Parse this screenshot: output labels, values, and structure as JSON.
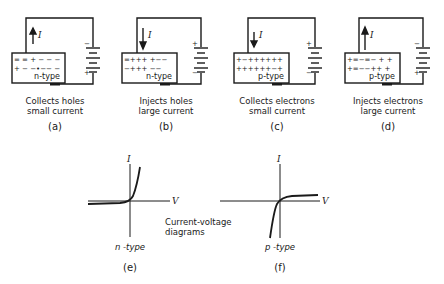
{
  "panels": [
    {
      "id": "a",
      "label": "(a)",
      "caption_line1": "Collects holes",
      "caption_line2": "small current",
      "material": "n-type",
      "current_dir": "up",
      "battery_top": "-",
      "battery_bottom": "+"
    },
    {
      "id": "b",
      "label": "(b)",
      "caption_line1": "Injects holes",
      "caption_line2": "large current",
      "material": "n-type",
      "current_dir": "down",
      "battery_top": "+",
      "battery_bottom": "-"
    },
    {
      "id": "c",
      "label": "(c)",
      "caption_line1": "Collects electrons",
      "caption_line2": "small current",
      "material": "p-type",
      "current_dir": "down",
      "battery_top": "+",
      "battery_bottom": "-"
    },
    {
      "id": "d",
      "label": "(d)",
      "caption_line1": "Injects electrons",
      "caption_line2": "large current",
      "material": "p-type",
      "current_dir": "up",
      "battery_top": "-",
      "battery_bottom": "+"
    }
  ],
  "current_symbol": "I",
  "graphs": [
    {
      "id": "e",
      "label": "(e)",
      "type_label": "n -type",
      "x_axis": "V",
      "y_axis": "I"
    },
    {
      "id": "f",
      "label": "(f)",
      "type_label": "p -type",
      "x_axis": "V",
      "y_axis": "I"
    }
  ],
  "graphs_caption_line1": "Current-voltage",
  "graphs_caption_line2": "diagrams",
  "colors": {
    "ink": "#1a1a1a",
    "background": "#ffffff"
  }
}
